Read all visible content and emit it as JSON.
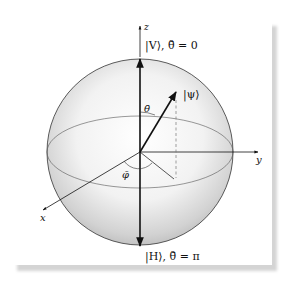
{
  "figure": {
    "axes": {
      "x_label": "x",
      "y_label": "y",
      "z_label": "z"
    },
    "poles": {
      "top_label": "|V⟩, θ̄ = 0",
      "bottom_label": "|H⟩, θ̄ = π"
    },
    "state_vector_label": "|ψ⟩",
    "angles": {
      "polar_label": "θ̄",
      "azimuthal_label": "φ̄"
    },
    "colors": {
      "line": "#111111",
      "sphere_light": "#ffffff",
      "sphere_dark": "#bdbdbd",
      "equator": "#555555",
      "shadow": "#d4d4d4"
    }
  }
}
